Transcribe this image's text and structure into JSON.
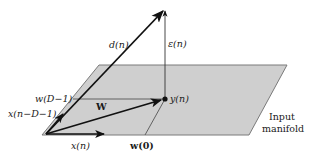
{
  "diagram": {
    "colors": {
      "plane_fill": "#cfcfcf",
      "plane_edge": "#7a7a7a",
      "vector": "#111111",
      "text": "#1a1a1a"
    },
    "labels": {
      "d_n": "d(n)",
      "epsilon_n": "ε(n)",
      "y_n": "y(n)",
      "W": "W",
      "w_D1": "w(D−1)",
      "x_nD1": "x(n−D−1)",
      "x_n": "x(n)",
      "w_0": "w(0)",
      "manifold_line1": "Input",
      "manifold_line2": "manifold"
    },
    "elements": [
      {
        "id": "input-manifold",
        "type": "parallelogram",
        "label": "Input manifold"
      },
      {
        "id": "d-vector",
        "type": "arrow",
        "from": "origin",
        "to": "apex",
        "label": "d(n)"
      },
      {
        "id": "epsilon-vector",
        "type": "arrow",
        "from": "y(n)",
        "to": "apex",
        "label": "ε(n)"
      },
      {
        "id": "W-vector",
        "type": "arrow",
        "from": "origin",
        "to": "y(n)",
        "label": "W"
      },
      {
        "id": "x-nD1-vector",
        "type": "arrow",
        "from": "origin",
        "label": "x(n−D−1)"
      },
      {
        "id": "x-n-vector",
        "type": "arrow",
        "from": "origin",
        "label": "x(n)"
      },
      {
        "id": "w-D1-line",
        "type": "projection-line",
        "label": "w(D−1)"
      },
      {
        "id": "w-0-line",
        "type": "projection-line",
        "label": "w(0)"
      }
    ]
  }
}
